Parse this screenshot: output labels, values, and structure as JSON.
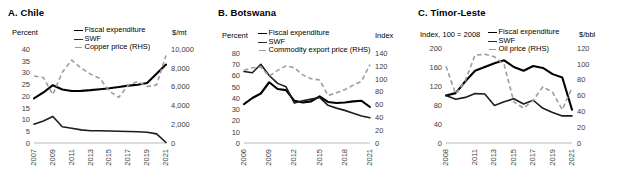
{
  "figure": {
    "panels": [
      {
        "id": "chile",
        "title": "A. Chile",
        "left_unit": "Percent",
        "right_unit": "$/mt",
        "legend": [
          {
            "label": "Fiscal expenditure",
            "key": "solid-thick"
          },
          {
            "label": "SWF",
            "key": "solid-med"
          },
          {
            "label": "Copper price (RHS)",
            "key": "dash"
          }
        ],
        "chart_data": {
          "type": "line",
          "title": "A. Chile",
          "xlabel": "",
          "ylabel": "Percent",
          "y2label": "$/mt",
          "grid": false,
          "legend_position": "top",
          "x": [
            2007,
            2008,
            2009,
            2010,
            2011,
            2012,
            2013,
            2014,
            2015,
            2016,
            2017,
            2018,
            2019,
            2020,
            2021
          ],
          "xticks": [
            "2007",
            "2009",
            "2011",
            "2013",
            "2015",
            "2017",
            "2019",
            "2021"
          ],
          "xtick_values": [
            2007,
            2009,
            2011,
            2013,
            2015,
            2017,
            2019,
            2021
          ],
          "ylim": [
            0,
            40
          ],
          "yticks": [
            0,
            5,
            10,
            15,
            20,
            25,
            30,
            35,
            40
          ],
          "y2lim": [
            0,
            10000
          ],
          "y2ticks": [
            0,
            2000,
            4000,
            6000,
            8000,
            10000
          ],
          "y2ticklabels": [
            "0",
            "2,000",
            "4,000",
            "6,000",
            "8,000",
            "10,000"
          ],
          "series": [
            {
              "name": "Fiscal expenditure",
              "axis": "left",
              "style": "solid-thick",
              "values": [
                19.0,
                21.5,
                24.6,
                22.8,
                22.1,
                22.2,
                22.5,
                22.9,
                23.3,
                23.8,
                24.4,
                24.8,
                25.5,
                29.5,
                33.4
              ]
            },
            {
              "name": "SWF",
              "axis": "left",
              "style": "solid-med",
              "values": [
                8.0,
                9.4,
                11.3,
                6.9,
                6.3,
                5.6,
                5.2,
                5.2,
                5.1,
                5.0,
                4.9,
                4.8,
                4.6,
                3.9,
                0.2
              ]
            },
            {
              "name": "Copper price (RHS)",
              "axis": "right",
              "style": "dash",
              "values": [
                7130,
                6960,
                5160,
                7530,
                8820,
                7960,
                7330,
                6860,
                5510,
                4860,
                6170,
                6530,
                6010,
                6180,
                9320
              ]
            }
          ]
        }
      },
      {
        "id": "botswana",
        "title": "B. Botswana",
        "left_unit": "Percent",
        "right_unit": "Index",
        "legend": [
          {
            "label": "Fiscal expenditure",
            "key": "solid-thick"
          },
          {
            "label": "SWF",
            "key": "solid-med"
          },
          {
            "label": "Commodity export price (RHS)",
            "key": "dash"
          }
        ],
        "chart_data": {
          "type": "line",
          "title": "B. Botswana",
          "xlabel": "",
          "ylabel": "Percent",
          "y2label": "Index",
          "grid": false,
          "legend_position": "top",
          "x": [
            2006,
            2007,
            2008,
            2009,
            2010,
            2011,
            2012,
            2013,
            2014,
            2015,
            2016,
            2017,
            2018,
            2019,
            2020,
            2021
          ],
          "xticks": [
            "2006",
            "2009",
            "2012",
            "2015",
            "2018",
            "2021"
          ],
          "xtick_values": [
            2006,
            2009,
            2012,
            2015,
            2018,
            2021
          ],
          "ylim": [
            0,
            80
          ],
          "yticks": [
            0,
            10,
            20,
            30,
            40,
            50,
            60,
            70,
            80
          ],
          "y2lim": [
            0,
            140
          ],
          "y2ticks": [
            0,
            20,
            40,
            60,
            80,
            100,
            120,
            140
          ],
          "series": [
            {
              "name": "Fiscal expenditure",
              "axis": "left",
              "style": "solid-thick",
              "values": [
                34.5,
                40.0,
                44.0,
                54.0,
                48.0,
                47.0,
                37.5,
                36.0,
                37.0,
                41.5,
                36.5,
                35.5,
                36.0,
                37.0,
                37.5,
                32.0
              ]
            },
            {
              "name": "SWF",
              "axis": "left",
              "style": "solid-med",
              "values": [
                63.5,
                62.5,
                70.0,
                60.0,
                53.0,
                50.0,
                35.5,
                37.5,
                39.0,
                40.5,
                33.5,
                31.0,
                29.0,
                26.5,
                24.0,
                22.5
              ]
            },
            {
              "name": "Commodity export price (RHS)",
              "axis": "right",
              "style": "dash",
              "values": [
                113,
                117,
                118,
                104,
                113,
                120,
                117,
                106,
                100,
                98,
                74,
                78,
                83,
                90,
                96,
                122
              ]
            }
          ]
        }
      },
      {
        "id": "timor-leste",
        "title": "C. Timor-Leste",
        "left_unit": "Index, 100 = 2008",
        "right_unit": "$/bbl",
        "legend": [
          {
            "label": "Fiscal expenditure",
            "key": "solid-thick"
          },
          {
            "label": "SWF",
            "key": "solid-med"
          },
          {
            "label": "Oil price (RHS)",
            "key": "dash"
          }
        ],
        "chart_data": {
          "type": "line",
          "title": "C. Timor-Leste",
          "xlabel": "",
          "ylabel": "Index, 100 = 2008",
          "y2label": "$/bbl",
          "grid": false,
          "legend_position": "top",
          "x": [
            2008,
            2009,
            2010,
            2011,
            2012,
            2013,
            2014,
            2015,
            2016,
            2017,
            2018,
            2019,
            2020,
            2021
          ],
          "xticks": [
            "2008",
            "2011",
            "2013",
            "2015",
            "2017",
            "2019",
            "2021"
          ],
          "xtick_values": [
            2008,
            2011,
            2013,
            2015,
            2017,
            2019,
            2021
          ],
          "ylim": [
            0,
            200
          ],
          "yticks": [
            0,
            40,
            80,
            120,
            160,
            200
          ],
          "y2lim": [
            0,
            120
          ],
          "y2ticks": [
            0,
            20,
            40,
            60,
            80,
            100,
            120
          ],
          "series": [
            {
              "name": "Fiscal expenditure",
              "axis": "left",
              "style": "solid-thick",
              "values": [
                100,
                105,
                130,
                152,
                160,
                168,
                174,
                160,
                152,
                162,
                158,
                145,
                138,
                70
              ]
            },
            {
              "name": "SWF",
              "axis": "left",
              "style": "solid-med",
              "values": [
                100,
                92,
                96,
                104,
                103,
                79,
                87,
                93,
                82,
                90,
                73,
                64,
                57,
                57
              ]
            },
            {
              "name": "Oil price (RHS)",
              "axis": "right",
              "style": "dash",
              "values": [
                97,
                62,
                79,
                111,
                112,
                109,
                99,
                52,
                44,
                54,
                71,
                64,
                42,
                70
              ]
            }
          ]
        }
      }
    ]
  }
}
